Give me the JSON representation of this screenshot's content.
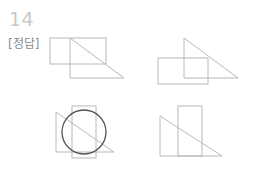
{
  "page": {
    "background_color": "#ffffff",
    "width": 258,
    "height": 179
  },
  "header": {
    "question_number": "14",
    "answer_label": "[정답]",
    "question_number_color": "#c9c9c9",
    "answer_label_color": "#8d8d8d"
  },
  "style": {
    "line_color": "#b8b8b8",
    "circle_color": "#555555",
    "line_width": "1"
  },
  "figures": [
    {
      "id": "figure-top-left",
      "name": "triangle-with-overlapping-rectangle",
      "shapes": [
        {
          "kind": "triangle",
          "points": "22,6 22,46 76,46",
          "orientation": "right-angle-bottom-left",
          "hypotenuse": "from apex top-left to base right"
        },
        {
          "kind": "rectangle",
          "x": 2,
          "y": 6,
          "width": 56,
          "height": 26
        }
      ]
    },
    {
      "id": "figure-top-right",
      "name": "triangle-with-overlapping-rectangle",
      "shapes": [
        {
          "kind": "triangle",
          "points": "32,6 32,46 86,46",
          "orientation": "right-angle-bottom-left",
          "hypotenuse": "from apex top to base right"
        },
        {
          "kind": "rectangle",
          "x": 6,
          "y": 26,
          "width": 50,
          "height": 26
        }
      ]
    },
    {
      "id": "figure-bottom-left",
      "name": "triangle-rectangle-and-circle",
      "shapes": [
        {
          "kind": "triangle",
          "points": "8,8 8,48 66,48",
          "orientation": "right-angle-bottom-left",
          "hypotenuse": "from apex top-left to base right"
        },
        {
          "kind": "rectangle",
          "x": 24,
          "y": 2,
          "width": 24,
          "height": 52
        },
        {
          "kind": "circle",
          "cx": 36,
          "cy": 28,
          "r": 22,
          "emphasis": "dark"
        }
      ]
    },
    {
      "id": "figure-bottom-right",
      "name": "triangle-with-tall-rectangle",
      "shapes": [
        {
          "kind": "triangle",
          "points": "8,12 8,52 70,52",
          "orientation": "right-angle-bottom-left",
          "hypotenuse": "from apex top-left to base right"
        },
        {
          "kind": "rectangle",
          "x": 26,
          "y": 2,
          "width": 24,
          "height": 50
        }
      ]
    }
  ]
}
